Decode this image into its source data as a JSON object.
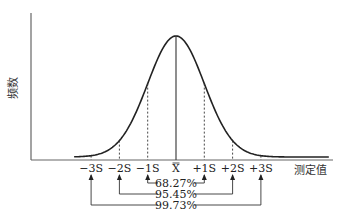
{
  "y_axis_label": "频数",
  "x_axis_label": "测定值",
  "ticks": [
    {
      "key": "m3",
      "label": "−3S",
      "sigma": -3
    },
    {
      "key": "m2",
      "label": "−2S",
      "sigma": -2
    },
    {
      "key": "m1",
      "label": "−1S",
      "sigma": -1
    },
    {
      "key": "mean",
      "label": "X",
      "sigma": 0
    },
    {
      "key": "p1",
      "label": "+1S",
      "sigma": 1
    },
    {
      "key": "p2",
      "label": "+2S",
      "sigma": 2
    },
    {
      "key": "p3",
      "label": "+3S",
      "sigma": 3
    }
  ],
  "intervals": [
    {
      "range_sigma": 1,
      "label": "68.27%"
    },
    {
      "range_sigma": 2,
      "label": "95.45%"
    },
    {
      "range_sigma": 3,
      "label": "99.73%"
    }
  ],
  "colors": {
    "line": "#222222",
    "axis": "#555555"
  }
}
